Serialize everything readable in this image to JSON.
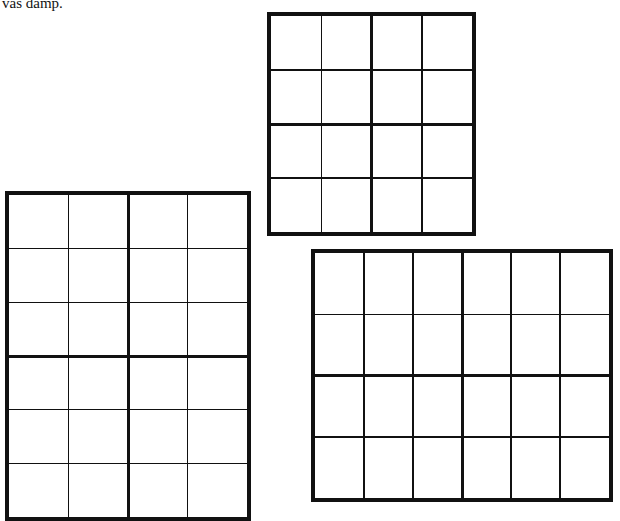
{
  "page": {
    "text_fragment": "vas damp.",
    "top_cut_text": "...g"
  },
  "grids": [
    {
      "name": "top-grid",
      "cols": 4,
      "rows": 4,
      "thick_col_after": 2,
      "thick_row_after": 2,
      "x": 267,
      "y": 12,
      "width": 209,
      "height": 224
    },
    {
      "name": "left-grid",
      "cols": 4,
      "rows": 6,
      "thick_col_after": 2,
      "thick_row_after": 3,
      "x": 5,
      "y": 191,
      "width": 246,
      "height": 330
    },
    {
      "name": "right-grid",
      "cols": 6,
      "rows": 4,
      "thick_col_after": 3,
      "thick_row_after": 2,
      "x": 311,
      "y": 249,
      "width": 302,
      "height": 253
    }
  ]
}
